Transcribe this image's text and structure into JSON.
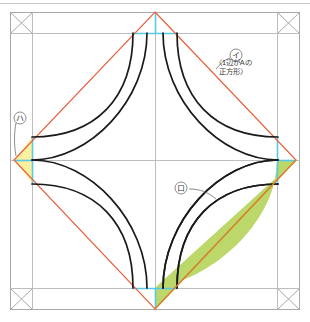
{
  "figure": {
    "title": "",
    "colors": {
      "diamond_stroke": "#e8603c",
      "arc_stroke": "#1a1a1a",
      "green_fill": "#bcd86a",
      "yellow_fill": "#faf0a0",
      "cyan_line": "#57c8e8",
      "grid_line": "#b8b8b8",
      "frame_line": "#a8a8a8",
      "label_text": "#3a3a3a",
      "background": "#ffffff"
    },
    "geometry": {
      "frame_outer": {
        "x": 10,
        "y": 12,
        "width": 290,
        "height": 298
      },
      "inner_guide": {
        "x": 32,
        "y": 33,
        "width": 246,
        "height": 256
      },
      "diamond_vertices": {
        "top": [
          155,
          12
        ],
        "right": [
          296,
          160
        ],
        "bottom": [
          155,
          309
        ],
        "left": [
          14,
          160
        ]
      },
      "center_cross": {
        "x": 155,
        "y": 160
      },
      "corner_marks": 4
    },
    "labels": {
      "label_i_mark": "イ",
      "label_i_line1": "〈1辺がAの",
      "label_i_line2": "正方形〉",
      "label_ha_mark": "ハ",
      "label_ro_mark": "ロ"
    }
  }
}
